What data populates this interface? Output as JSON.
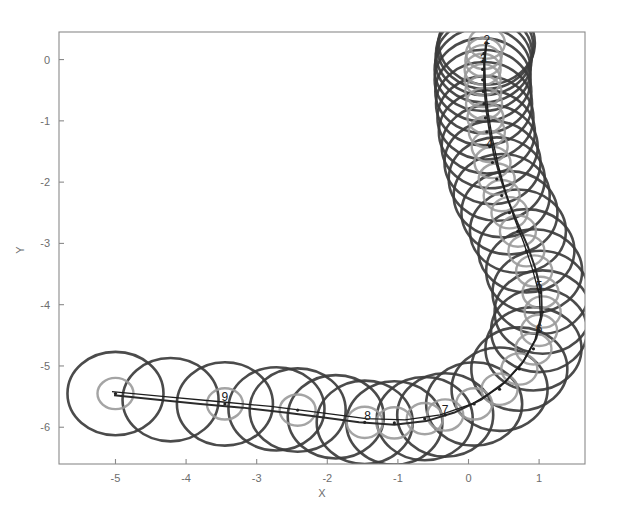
{
  "figure": {
    "background_color": "#ffffff",
    "width": 618,
    "height": 526
  },
  "axes": {
    "frame_color": "#8a8a8a",
    "tick_label_color": "#6d6d6d",
    "x_title": "X",
    "y_title": "Y",
    "x_ticks": [
      "-5",
      "-4",
      "-3",
      "-2",
      "-1",
      "0",
      "1"
    ],
    "y_ticks": [
      "0",
      "-1",
      "-2",
      "-3",
      "-4",
      "-5",
      "-6"
    ]
  },
  "chart_data": {
    "type": "scatter",
    "title": "",
    "xlabel": "X",
    "ylabel": "Y",
    "xlim": [
      -5.8,
      1.65
    ],
    "ylim": [
      -6.6,
      0.45
    ],
    "grid": false,
    "legend": null,
    "xticks": [
      -5,
      -4,
      -3,
      -2,
      -1,
      0,
      1
    ],
    "yticks": [
      0,
      -1,
      -2,
      -3,
      -4,
      -5,
      -6
    ],
    "series": [
      {
        "name": "uncertainty-circles-outer",
        "color": "#3c3c3c",
        "radius_data_units": 0.68,
        "points": [
          {
            "x": -5.0,
            "y": -5.45,
            "label": ""
          },
          {
            "x": -4.22,
            "y": -5.55,
            "label": ""
          },
          {
            "x": -3.45,
            "y": -5.62,
            "label": "9"
          },
          {
            "x": -2.72,
            "y": -5.7,
            "label": ""
          },
          {
            "x": -2.42,
            "y": -5.72,
            "label": ""
          },
          {
            "x": -1.88,
            "y": -5.83,
            "label": ""
          },
          {
            "x": -1.47,
            "y": -5.92,
            "label": "8"
          },
          {
            "x": -1.05,
            "y": -5.93,
            "label": ""
          },
          {
            "x": -0.62,
            "y": -5.86,
            "label": ""
          },
          {
            "x": -0.33,
            "y": -5.8,
            "label": "7"
          },
          {
            "x": 0.08,
            "y": -5.62,
            "label": ""
          },
          {
            "x": 0.44,
            "y": -5.38,
            "label": ""
          },
          {
            "x": 0.72,
            "y": -5.05,
            "label": ""
          },
          {
            "x": 0.92,
            "y": -4.72,
            "label": ""
          },
          {
            "x": 1.0,
            "y": -4.42,
            "label": "6"
          },
          {
            "x": 1.05,
            "y": -4.12,
            "label": ""
          },
          {
            "x": 1.02,
            "y": -3.8,
            "label": "5"
          },
          {
            "x": 0.93,
            "y": -3.45,
            "label": ""
          },
          {
            "x": 0.82,
            "y": -3.12,
            "label": ""
          },
          {
            "x": 0.7,
            "y": -2.8,
            "label": ""
          },
          {
            "x": 0.58,
            "y": -2.5,
            "label": ""
          },
          {
            "x": 0.47,
            "y": -2.22,
            "label": ""
          },
          {
            "x": 0.4,
            "y": -1.95,
            "label": ""
          },
          {
            "x": 0.34,
            "y": -1.68,
            "label": ""
          },
          {
            "x": 0.3,
            "y": -1.42,
            "label": "4"
          },
          {
            "x": 0.26,
            "y": -1.18,
            "label": ""
          },
          {
            "x": 0.24,
            "y": -0.95,
            "label": ""
          },
          {
            "x": 0.22,
            "y": -0.72,
            "label": ""
          },
          {
            "x": 0.21,
            "y": -0.52,
            "label": ""
          },
          {
            "x": 0.2,
            "y": -0.33,
            "label": ""
          },
          {
            "x": 0.2,
            "y": -0.16,
            "label": ""
          },
          {
            "x": 0.21,
            "y": -0.02,
            "label": "3"
          },
          {
            "x": 0.22,
            "y": 0.1,
            "label": ""
          },
          {
            "x": 0.24,
            "y": 0.2,
            "label": ""
          },
          {
            "x": 0.26,
            "y": 0.27,
            "label": "2"
          }
        ]
      },
      {
        "name": "uncertainty-circles-inner",
        "color": "#9a9a9a",
        "radius_data_units": 0.255,
        "points": [
          {
            "x": -5.0,
            "y": -5.45
          },
          {
            "x": -3.45,
            "y": -5.62
          },
          {
            "x": -2.42,
            "y": -5.72
          },
          {
            "x": -1.47,
            "y": -5.92
          },
          {
            "x": -1.05,
            "y": -5.93
          },
          {
            "x": -0.62,
            "y": -5.86
          },
          {
            "x": -0.33,
            "y": -5.8
          },
          {
            "x": 0.08,
            "y": -5.62
          },
          {
            "x": 0.44,
            "y": -5.38
          },
          {
            "x": 0.72,
            "y": -5.05
          },
          {
            "x": 0.92,
            "y": -4.72
          },
          {
            "x": 1.0,
            "y": -4.42
          },
          {
            "x": 1.05,
            "y": -4.12
          },
          {
            "x": 1.02,
            "y": -3.8
          },
          {
            "x": 0.93,
            "y": -3.45
          },
          {
            "x": 0.82,
            "y": -3.12
          },
          {
            "x": 0.7,
            "y": -2.8
          },
          {
            "x": 0.58,
            "y": -2.5
          },
          {
            "x": 0.47,
            "y": -2.22
          },
          {
            "x": 0.4,
            "y": -1.95
          },
          {
            "x": 0.34,
            "y": -1.68
          },
          {
            "x": 0.3,
            "y": -1.42
          },
          {
            "x": 0.26,
            "y": -1.18
          },
          {
            "x": 0.24,
            "y": -0.95
          },
          {
            "x": 0.22,
            "y": -0.72
          },
          {
            "x": 0.21,
            "y": -0.52
          },
          {
            "x": 0.2,
            "y": -0.33
          },
          {
            "x": 0.2,
            "y": -0.16
          },
          {
            "x": 0.21,
            "y": -0.02
          },
          {
            "x": 0.22,
            "y": 0.1
          },
          {
            "x": 0.26,
            "y": 0.27
          }
        ]
      }
    ],
    "trajectory": {
      "name": "robot-path",
      "color": "#2b2b2b",
      "points": [
        {
          "x": -5.02,
          "y": -5.48
        },
        {
          "x": -4.4,
          "y": -5.55
        },
        {
          "x": -3.8,
          "y": -5.62
        },
        {
          "x": -3.2,
          "y": -5.68
        },
        {
          "x": -2.6,
          "y": -5.76
        },
        {
          "x": -2.05,
          "y": -5.84
        },
        {
          "x": -1.55,
          "y": -5.92
        },
        {
          "x": -1.05,
          "y": -5.96
        },
        {
          "x": -0.6,
          "y": -5.9
        },
        {
          "x": -0.2,
          "y": -5.76
        },
        {
          "x": 0.18,
          "y": -5.55
        },
        {
          "x": 0.52,
          "y": -5.26
        },
        {
          "x": 0.78,
          "y": -4.92
        },
        {
          "x": 0.96,
          "y": -4.55
        },
        {
          "x": 1.04,
          "y": -4.18
        },
        {
          "x": 1.03,
          "y": -3.8
        },
        {
          "x": 0.95,
          "y": -3.42
        },
        {
          "x": 0.84,
          "y": -3.05
        },
        {
          "x": 0.7,
          "y": -2.68
        },
        {
          "x": 0.56,
          "y": -2.3
        },
        {
          "x": 0.45,
          "y": -1.92
        },
        {
          "x": 0.36,
          "y": -1.55
        },
        {
          "x": 0.3,
          "y": -1.18
        },
        {
          "x": 0.25,
          "y": -0.8
        },
        {
          "x": 0.22,
          "y": -0.42
        },
        {
          "x": 0.22,
          "y": -0.05
        },
        {
          "x": 0.25,
          "y": 0.28
        }
      ]
    },
    "secondary_trajectory": {
      "name": "estimated-path",
      "color": "#1d1d1d",
      "points": [
        {
          "x": -5.05,
          "y": -5.42
        },
        {
          "x": -4.3,
          "y": -5.5
        },
        {
          "x": -3.55,
          "y": -5.58
        },
        {
          "x": -2.8,
          "y": -5.66
        },
        {
          "x": -2.1,
          "y": -5.76
        },
        {
          "x": -1.45,
          "y": -5.86
        },
        {
          "x": -0.9,
          "y": -5.88
        },
        {
          "x": -0.4,
          "y": -5.8
        },
        {
          "x": 0.05,
          "y": -5.62
        },
        {
          "x": 0.45,
          "y": -5.34
        },
        {
          "x": 0.75,
          "y": -4.98
        },
        {
          "x": 0.94,
          "y": -4.58
        },
        {
          "x": 1.02,
          "y": -4.2
        },
        {
          "x": 1.0,
          "y": -3.82
        },
        {
          "x": 0.9,
          "y": -3.4
        },
        {
          "x": 0.78,
          "y": -2.98
        },
        {
          "x": 0.64,
          "y": -2.56
        },
        {
          "x": 0.52,
          "y": -2.14
        },
        {
          "x": 0.42,
          "y": -1.72
        },
        {
          "x": 0.34,
          "y": -1.3
        },
        {
          "x": 0.28,
          "y": -0.88
        },
        {
          "x": 0.24,
          "y": -0.46
        },
        {
          "x": 0.23,
          "y": -0.05
        },
        {
          "x": 0.26,
          "y": 0.3
        }
      ]
    },
    "node_labels": [
      {
        "text": "9",
        "x": -3.45,
        "y": -5.58
      },
      {
        "text": "8",
        "x": -1.43,
        "y": -5.88
      },
      {
        "text": "7",
        "x": -0.33,
        "y": -5.78
      },
      {
        "text": "6",
        "x": 1.0,
        "y": -4.46
      },
      {
        "text": "5",
        "x": 1.0,
        "y": -3.76
      },
      {
        "text": "4",
        "x": 0.3,
        "y": -1.44
      },
      {
        "text": "3",
        "x": 0.21,
        "y": -0.05
      },
      {
        "text": "2",
        "x": 0.26,
        "y": 0.25
      }
    ]
  }
}
